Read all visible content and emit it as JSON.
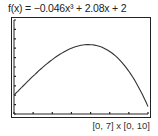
{
  "header": {
    "function_label": "f(x) = −0.046x³ + 2.08x + 2"
  },
  "footer": {
    "window_label": "[0, 7] x [0, 10]"
  },
  "colors": {
    "curve": "#333333",
    "frame": "#222222",
    "background": "#ffffff"
  },
  "chart_data": {
    "type": "line",
    "xlabel": "",
    "ylabel": "",
    "xlim": [
      0,
      7
    ],
    "ylim": [
      0,
      10
    ],
    "x_ticks": [
      0,
      1,
      2,
      3,
      4,
      5,
      6,
      7
    ],
    "y_ticks": [
      0,
      1,
      2,
      3,
      4,
      5,
      6,
      7,
      8,
      9,
      10
    ],
    "grid": false,
    "legend": "none",
    "annotations": [
      "[0, 7] x [0, 10]"
    ],
    "series": [
      {
        "name": "f(x)",
        "x": [
          0,
          0.5,
          1,
          1.5,
          2,
          2.5,
          3,
          3.5,
          4,
          4.5,
          5,
          5.5,
          6,
          6.5,
          7
        ],
        "values": [
          2.0,
          3.03,
          4.03,
          4.96,
          5.79,
          6.48,
          7.0,
          7.31,
          7.38,
          7.17,
          6.65,
          5.78,
          4.54,
          2.89,
          0.78
        ]
      }
    ]
  }
}
